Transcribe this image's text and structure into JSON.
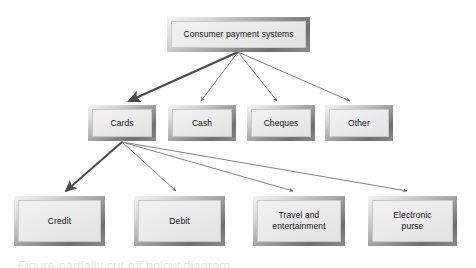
{
  "diagram": {
    "type": "hierarchy-tree",
    "levels": 3,
    "root": {
      "id": "consumer-payment-systems",
      "label": "Consumer payment systems",
      "x": 167,
      "y": 17,
      "w": 143,
      "h": 35
    },
    "level2": [
      {
        "id": "cards",
        "label": "Cards",
        "x": 88,
        "y": 105,
        "w": 68,
        "h": 36
      },
      {
        "id": "cash",
        "label": "Cash",
        "x": 168,
        "y": 105,
        "w": 68,
        "h": 36
      },
      {
        "id": "cheques",
        "label": "Cheques",
        "x": 247,
        "y": 105,
        "w": 68,
        "h": 36
      },
      {
        "id": "other",
        "label": "Other",
        "x": 325,
        "y": 105,
        "w": 68,
        "h": 36
      }
    ],
    "level3": [
      {
        "id": "credit",
        "label": "Credit",
        "label2": "",
        "x": 14,
        "y": 196,
        "w": 91,
        "h": 50
      },
      {
        "id": "debit",
        "label": "Debit",
        "label2": "",
        "x": 134,
        "y": 196,
        "w": 91,
        "h": 50
      },
      {
        "id": "travel-and-entertainment",
        "label": "Travel and",
        "label2": "entertainment",
        "x": 253,
        "y": 196,
        "w": 92,
        "h": 50
      },
      {
        "id": "electronic-purse",
        "label": "Electronic",
        "label2": "purse",
        "x": 368,
        "y": 196,
        "w": 89,
        "h": 50
      }
    ],
    "edges": [
      {
        "from": "consumer-payment-systems",
        "to": "cards",
        "emphasis": "bold"
      },
      {
        "from": "consumer-payment-systems",
        "to": "cash",
        "emphasis": "thin"
      },
      {
        "from": "consumer-payment-systems",
        "to": "cheques",
        "emphasis": "thin"
      },
      {
        "from": "consumer-payment-systems",
        "to": "other",
        "emphasis": "thin"
      },
      {
        "from": "cards",
        "to": "credit",
        "emphasis": "bold"
      },
      {
        "from": "cards",
        "to": "debit",
        "emphasis": "thin"
      },
      {
        "from": "cards",
        "to": "travel-and-entertainment",
        "emphasis": "thin"
      },
      {
        "from": "cards",
        "to": "electronic-purse",
        "emphasis": "thin"
      }
    ],
    "colors": {
      "arrow": "#6b6b6b",
      "arrow_bold": "#4a4a4a",
      "box_fill": "#ebebeb",
      "box_frame_dark": "#6f6f6f",
      "box_frame_light": "#f4f4f4",
      "text": "#111111",
      "background": "#ffffff"
    },
    "caption_sliver": "Figure partially cut off below diagram"
  }
}
